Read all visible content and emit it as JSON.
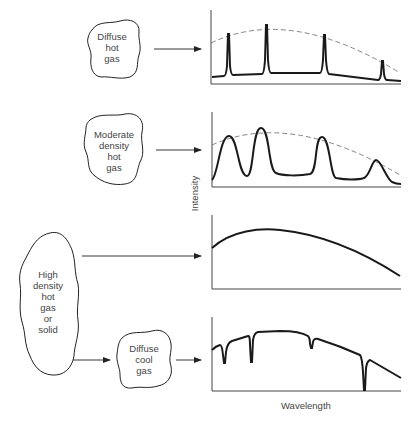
{
  "sources": [
    {
      "id": "diffuse-hot-gas",
      "lines": [
        "Diffuse",
        "hot",
        "gas"
      ],
      "spectrum": "emission-lines"
    },
    {
      "id": "moderate-density-hot-gas",
      "lines": [
        "Moderate",
        "density",
        "hot",
        "gas"
      ],
      "spectrum": "broadened-emission-lines"
    },
    {
      "id": "high-density-hot-gas-or-solid",
      "lines": [
        "High",
        "density",
        "hot",
        "gas",
        "or",
        "solid"
      ],
      "spectrum": "continuous"
    },
    {
      "id": "diffuse-cool-gas",
      "lines": [
        "Diffuse",
        "cool",
        "gas"
      ],
      "spectrum": "absorption-lines"
    }
  ],
  "axes": {
    "ylabel": "Intensity",
    "xlabel": "Wavelength"
  },
  "colors": {
    "line": "#1a1a1a",
    "envelope": "#777777",
    "text": "#444444"
  }
}
